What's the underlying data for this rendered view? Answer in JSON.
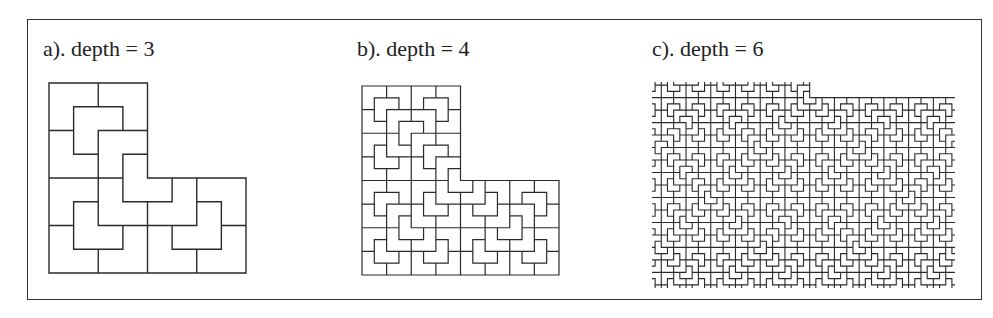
{
  "figure": {
    "frame": {
      "border_color": "#333333"
    },
    "line_color": "#2a2a2a",
    "panels": [
      {
        "id": "a",
        "label": "a). depth = 3",
        "depth": 3,
        "shape": "L-tromino (top-right quadrant missing)",
        "view": {
          "x0": 0,
          "y0": 0,
          "x1": 8,
          "y1": 8
        },
        "px": {
          "left": 49,
          "top": 83,
          "width": 197,
          "height": 190
        },
        "label_pos": {
          "left": 43,
          "top": 38
        },
        "stroke": 1.4,
        "crop": false
      },
      {
        "id": "b",
        "label": "b). depth = 4",
        "depth": 4,
        "shape": "L-tromino (top-right quadrant missing)",
        "view": {
          "x0": 0,
          "y0": 0,
          "x1": 16,
          "y1": 16
        },
        "px": {
          "left": 362,
          "top": 86,
          "width": 197,
          "height": 189
        },
        "label_pos": {
          "left": 357,
          "top": 38
        },
        "stroke": 1.2,
        "crop": false
      },
      {
        "id": "c",
        "label": "c). depth = 6",
        "depth": 6,
        "shape": "L-tromino tiling (cropped interior)",
        "view": {
          "x0": 6.5,
          "y0": 29.5,
          "x1": 55.5,
          "y1": 62.5
        },
        "px": {
          "left": 652,
          "top": 82,
          "width": 303,
          "height": 206
        },
        "label_pos": {
          "left": 652,
          "top": 38
        },
        "stroke": 1.1,
        "crop": true
      }
    ]
  }
}
